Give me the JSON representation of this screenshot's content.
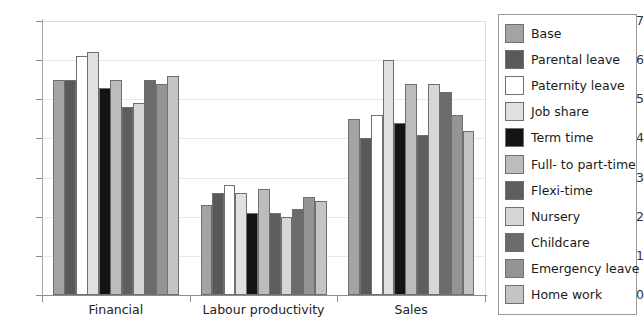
{
  "chart_data": {
    "type": "bar",
    "title": "",
    "xlabel": "",
    "ylabel": "",
    "categories": [
      "Financial",
      "Labour productivity",
      "Sales"
    ],
    "ylim": [
      0,
      0.7
    ],
    "ytick_labels": [
      "0",
      "0.1",
      "0.2",
      "0.3",
      "0.4",
      "0.5",
      "0.6",
      "0.7"
    ],
    "ytick_values": [
      0,
      0.1,
      0.2,
      0.3,
      0.4,
      0.5,
      0.6,
      0.7
    ],
    "grid": true,
    "legend_position": "right",
    "series": [
      {
        "name": "Base",
        "color": "#a3a3a3",
        "values": [
          0.55,
          0.23,
          0.45
        ]
      },
      {
        "name": "Parental leave",
        "color": "#595959",
        "values": [
          0.55,
          0.26,
          0.4
        ]
      },
      {
        "name": "Paternity leave",
        "color": "#ffffff",
        "values": [
          0.61,
          0.28,
          0.46
        ]
      },
      {
        "name": "Job share",
        "color": "#e0e0e0",
        "values": [
          0.62,
          0.26,
          0.6
        ]
      },
      {
        "name": "Term time",
        "color": "#141414",
        "values": [
          0.53,
          0.21,
          0.44
        ]
      },
      {
        "name": "Full- to part-time",
        "color": "#bcbcbc",
        "values": [
          0.55,
          0.27,
          0.54
        ]
      },
      {
        "name": "Flexi-time",
        "color": "#5e5e5e",
        "values": [
          0.48,
          0.21,
          0.41
        ]
      },
      {
        "name": "Nursery",
        "color": "#d6d6d6",
        "values": [
          0.49,
          0.2,
          0.54
        ]
      },
      {
        "name": "Childcare",
        "color": "#6b6b6b",
        "values": [
          0.55,
          0.22,
          0.52
        ]
      },
      {
        "name": "Emergency leave",
        "color": "#949494",
        "values": [
          0.54,
          0.25,
          0.46
        ]
      },
      {
        "name": "Home work",
        "color": "#c4c4c4",
        "values": [
          0.56,
          0.24,
          0.42
        ]
      }
    ]
  }
}
